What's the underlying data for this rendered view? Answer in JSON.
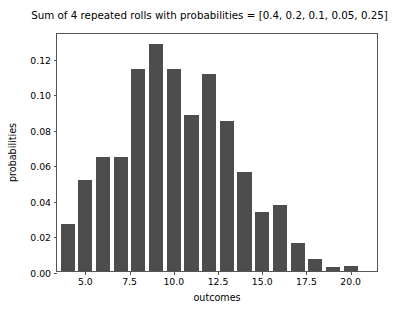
{
  "chart_data": {
    "type": "bar",
    "title": "Sum of 4 repeated rolls with probabilities = [0.4, 0.2, 0.1, 0.05, 0.25]",
    "xlabel": "outcomes",
    "ylabel": "probabilities",
    "grid": false,
    "legend": null,
    "xlim": [
      3.4,
      21.6
    ],
    "ylim": [
      0.0,
      0.1345
    ],
    "categories": [
      4,
      5,
      6,
      7,
      8,
      9,
      10,
      11,
      12,
      13,
      14,
      15,
      16,
      17,
      18,
      19,
      20,
      21
    ],
    "values": [
      0.0265,
      0.051,
      0.064,
      0.064,
      0.1135,
      0.128,
      0.1135,
      0.088,
      0.111,
      0.0845,
      0.0555,
      0.033,
      0.037,
      0.0155,
      0.007,
      0.002,
      0.0027,
      0.0
    ],
    "xticks": [
      5.0,
      7.5,
      10.0,
      12.5,
      15.0,
      17.5,
      20.0
    ],
    "xticklabels": [
      "5.0",
      "7.5",
      "10.0",
      "12.5",
      "15.0",
      "17.5",
      "20.0"
    ],
    "yticks": [
      0.0,
      0.02,
      0.04,
      0.06,
      0.08,
      0.1,
      0.12
    ],
    "yticklabels": [
      "0.00",
      "0.02",
      "0.04",
      "0.06",
      "0.08",
      "0.10",
      "0.12"
    ],
    "bar_color": "#4d4d4d",
    "axis_color": "#555555",
    "background_color": "#ffffff",
    "bar_width": 0.8
  }
}
